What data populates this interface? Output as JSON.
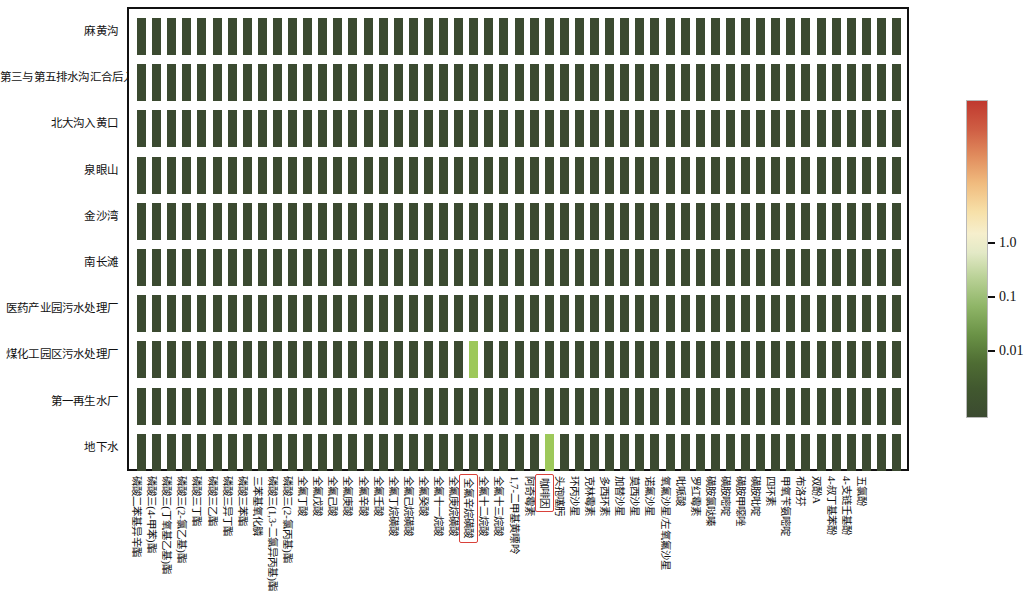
{
  "figure": {
    "type": "heatmap",
    "row_count": 10,
    "column_count": 51
  },
  "rows": [
    {
      "label": "麻黄沟"
    },
    {
      "label": "第三与第五排水沟汇合后入黄"
    },
    {
      "label": "北大沟入黄口"
    },
    {
      "label": "泉眼山"
    },
    {
      "label": "金沙湾"
    },
    {
      "label": "南长滩"
    },
    {
      "label": "医药产业园污水处理厂"
    },
    {
      "label": "煤化工园区污水处理厂"
    },
    {
      "label": "第一再生水厂"
    },
    {
      "label": "地下水"
    }
  ],
  "columns": [
    {
      "label": "磷酸二苯基异辛酯",
      "highlighted": false
    },
    {
      "label": "磷酸三(4-甲苯)酯",
      "highlighted": false
    },
    {
      "label": "磷酸三(丁氧基乙基)酯",
      "highlighted": false
    },
    {
      "label": "磷酸三(2-氯乙基)酯",
      "highlighted": false
    },
    {
      "label": "磷酸三丁酯",
      "highlighted": false
    },
    {
      "label": "磷酸三乙酯",
      "highlighted": false
    },
    {
      "label": "磷酸三异丁酯",
      "highlighted": false
    },
    {
      "label": "磷酸三苯酯",
      "highlighted": false
    },
    {
      "label": "三苯基氧化膦",
      "highlighted": false
    },
    {
      "label": "磷酸三(1,3-二氯异丙基)酯",
      "highlighted": false
    },
    {
      "label": "磷酸三(2-氯丙基)酯",
      "highlighted": false
    },
    {
      "label": "全氟丁酸",
      "highlighted": false
    },
    {
      "label": "全氟戊酸",
      "highlighted": false
    },
    {
      "label": "全氟己酸",
      "highlighted": false
    },
    {
      "label": "全氟庚酸",
      "highlighted": false
    },
    {
      "label": "全氟辛酸",
      "highlighted": false
    },
    {
      "label": "全氟壬酸",
      "highlighted": false
    },
    {
      "label": "全氟丁烷磺酸",
      "highlighted": false
    },
    {
      "label": "全氟己烷磺酸",
      "highlighted": false
    },
    {
      "label": "全氟癸酸",
      "highlighted": false
    },
    {
      "label": "全氟十一烷酸",
      "highlighted": false
    },
    {
      "label": "全氟庚烷磺酸",
      "highlighted": false
    },
    {
      "label": "全氟辛烷磺酸",
      "highlighted": true
    },
    {
      "label": "全氟十二烷酸",
      "highlighted": false
    },
    {
      "label": "全氟十三烷酸",
      "highlighted": false
    },
    {
      "label": "1,7-二甲基黄嘌呤",
      "highlighted": false
    },
    {
      "label": "阿奇霉素",
      "highlighted": false
    },
    {
      "label": "咖啡因",
      "highlighted": true
    },
    {
      "label": "头孢噻肟",
      "highlighted": false
    },
    {
      "label": "环丙沙星",
      "highlighted": false
    },
    {
      "label": "克林霉素",
      "highlighted": false
    },
    {
      "label": "多西环素",
      "highlighted": false
    },
    {
      "label": "加替沙星",
      "highlighted": false
    },
    {
      "label": "莫西沙星",
      "highlighted": false
    },
    {
      "label": "诺氟沙星",
      "highlighted": false
    },
    {
      "label": "氧氟沙星/左氧氟沙星",
      "highlighted": false
    },
    {
      "label": "吡哌酸",
      "highlighted": false
    },
    {
      "label": "罗红霉素",
      "highlighted": false
    },
    {
      "label": "磺胺氯哒嗪",
      "highlighted": false
    },
    {
      "label": "磺胺嘧啶",
      "highlighted": false
    },
    {
      "label": "磺胺甲噁唑",
      "highlighted": false
    },
    {
      "label": "磺胺吡啶",
      "highlighted": false
    },
    {
      "label": "四环素",
      "highlighted": false
    },
    {
      "label": "甲氧苄氨嘧啶",
      "highlighted": false
    },
    {
      "label": "布洛芬",
      "highlighted": false
    },
    {
      "label": "双酚A",
      "highlighted": false
    },
    {
      "label": "4-叔丁基苯酚",
      "highlighted": false
    },
    {
      "label": "4-支链壬基酚",
      "highlighted": false
    },
    {
      "label": "五氯酚",
      "highlighted": false
    },
    {
      "label": "",
      "highlighted": false
    },
    {
      "label": "",
      "highlighted": false
    }
  ],
  "colorbar": {
    "scale": "log",
    "ticks": [
      {
        "label": "1.0",
        "value": 1.0,
        "position": 0.555
      },
      {
        "label": "0.1",
        "value": 0.1,
        "position": 0.385
      },
      {
        "label": "0.01",
        "value": 0.01,
        "position": 0.215
      }
    ],
    "low_color": "#3b4a30",
    "mid_color": "#f6efcd",
    "high_color": "#c0392f",
    "highlight_color": "#9dc85a",
    "base_cell_color": "#3b4a30"
  },
  "chart_data": {
    "type": "heatmap",
    "title": "",
    "xlabel": "",
    "ylabel": "",
    "colorbar_label": "",
    "scale": "log",
    "value_range": [
      0.001,
      3.0
    ],
    "grid": false,
    "legend": "right",
    "highlighted_cells": [
      {
        "row": "煤化工园区污水处理厂",
        "column": "全氟辛烷磺酸",
        "value": 0.06,
        "color": "#9dc85a"
      },
      {
        "row": "地下水",
        "column": "咖啡因",
        "value": 0.06,
        "color": "#9dc85a"
      }
    ],
    "default_value": 0.003,
    "note": "All cells dark green (low) except two light-green highlighted cells"
  }
}
